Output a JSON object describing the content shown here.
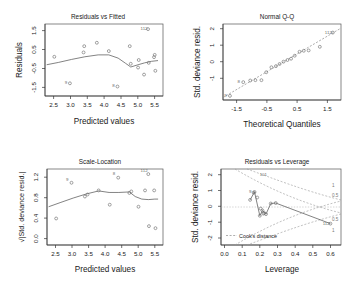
{
  "figure": {
    "name": "glm-diagnostic-plots",
    "layout": "2x2",
    "background": "#ffffff",
    "point_color": "#6f6f6f",
    "line_color": "#5a5a5a"
  },
  "chart_data": [
    {
      "type": "scatter",
      "id": "residuals-vs-fitted",
      "title": "Residuals vs Fitted",
      "xlabel": "Predicted values",
      "ylabel": "Residuals",
      "xlim": [
        2.2,
        5.75
      ],
      "ylim": [
        -1.95,
        1.85
      ],
      "xticks": [
        "2.5",
        "3.0",
        "3.5",
        "4.0",
        "4.5",
        "5.0",
        "5.5"
      ],
      "xtickvals": [
        2.5,
        3.0,
        3.5,
        4.0,
        4.5,
        5.0,
        5.5
      ],
      "yticks": [
        "1.5",
        "0.5",
        "-0.5",
        "-1.5"
      ],
      "ytickvals": [
        1.5,
        0.5,
        -0.5,
        -1.5
      ],
      "grid": false,
      "legend": "none",
      "x": [
        2.48,
        2.95,
        3.36,
        3.38,
        3.76,
        4.12,
        4.38,
        4.75,
        4.78,
        5.0,
        5.02,
        5.18,
        5.3,
        5.32,
        5.48,
        5.5,
        5.52
      ],
      "y": [
        0.12,
        -1.28,
        0.35,
        0.68,
        0.86,
        0.42,
        -1.45,
        0.68,
        -0.25,
        -0.45,
        -0.05,
        -0.82,
        1.58,
        -0.2,
        0.1,
        0.22,
        -0.62
      ],
      "point_labels": [
        "",
        "9",
        "",
        "",
        "",
        "",
        "8",
        "",
        "",
        "",
        "",
        "",
        "112",
        "",
        "",
        "",
        ""
      ],
      "smooth": {
        "name": "loess smoother",
        "x": [
          2.25,
          2.6,
          3.0,
          3.4,
          3.8,
          4.12,
          4.4,
          4.62,
          4.78,
          5.0,
          5.2,
          5.4,
          5.6
        ],
        "y": [
          -0.3,
          -0.18,
          -0.02,
          0.12,
          0.22,
          0.22,
          0.05,
          -0.22,
          -0.42,
          -0.3,
          -0.2,
          -0.12,
          -0.08
        ]
      }
    },
    {
      "type": "scatter",
      "id": "normal-qq",
      "title": "Normal Q-Q",
      "xlabel": "Theoretical Quantiles",
      "ylabel": "Std. deviance resid.",
      "xlim": [
        -1.95,
        1.95
      ],
      "ylim": [
        -2.3,
        2.3
      ],
      "xticks": [
        "-1.5",
        "-0.5",
        "0.5",
        "1.5"
      ],
      "xtickvals": [
        -1.5,
        -0.5,
        0.5,
        1.5
      ],
      "yticks": [
        "2",
        "1",
        "0",
        "-1"
      ],
      "ytickvals": [
        2,
        1,
        0,
        -1
      ],
      "grid": false,
      "legend": "none",
      "x": [
        -1.72,
        -1.28,
        -1.05,
        -0.88,
        -0.68,
        -0.52,
        -0.35,
        -0.2,
        -0.08,
        0.05,
        0.18,
        0.3,
        0.42,
        0.58,
        0.72,
        0.88,
        1.25,
        1.68
      ],
      "y": [
        -2.05,
        -1.22,
        -1.12,
        -1.1,
        -1.1,
        -0.62,
        -0.32,
        -0.25,
        -0.12,
        0.02,
        0.12,
        0.2,
        0.38,
        0.62,
        0.68,
        0.7,
        0.92,
        1.78
      ],
      "point_labels": [
        "9",
        "8",
        "",
        "",
        "",
        "",
        "",
        "",
        "",
        "",
        "",
        "",
        "",
        "",
        "",
        "",
        "",
        "112"
      ],
      "refline": {
        "name": "qq reference line",
        "x": [
          -1.95,
          1.95
        ],
        "y": [
          -2.15,
          2.05
        ]
      }
    },
    {
      "type": "scatter",
      "id": "scale-location",
      "title": "Scale-Location",
      "xlabel": "Predicted values",
      "ylabel": "√|Std. deviance resid.|",
      "xlim": [
        2.2,
        5.75
      ],
      "ylim": [
        -0.07,
        1.42
      ],
      "xticks": [
        "2.5",
        "3.0",
        "3.5",
        "4.0",
        "4.5",
        "5.0",
        "5.5"
      ],
      "xtickvals": [
        2.5,
        3.0,
        3.5,
        4.0,
        4.5,
        5.0,
        5.5
      ],
      "yticks": [
        "0.0",
        "0.4",
        "0.8",
        "1.2"
      ],
      "ytickvals": [
        0.0,
        0.4,
        0.8,
        1.2
      ],
      "grid": false,
      "legend": "none",
      "x": [
        2.48,
        2.95,
        3.36,
        3.44,
        3.78,
        4.12,
        4.38,
        4.72,
        4.78,
        5.0,
        5.2,
        5.3,
        5.32,
        5.48,
        5.52
      ],
      "y": [
        0.45,
        1.15,
        0.88,
        0.92,
        1.0,
        0.72,
        1.25,
        0.95,
        0.98,
        0.68,
        1.0,
        1.32,
        0.3,
        1.0,
        0.26
      ],
      "point_labels": [
        "",
        "9",
        "",
        "",
        "",
        "",
        "8",
        "",
        "",
        "",
        "",
        "112",
        "",
        "",
        ""
      ],
      "smooth": {
        "name": "loess smoother",
        "x": [
          2.25,
          2.6,
          3.0,
          3.4,
          3.78,
          4.1,
          4.4,
          4.72,
          4.9,
          5.1,
          5.3,
          5.5,
          5.6
        ],
        "y": [
          0.68,
          0.76,
          0.85,
          0.93,
          0.99,
          0.96,
          0.96,
          0.97,
          0.88,
          0.83,
          0.82,
          0.83,
          0.83
        ]
      }
    },
    {
      "type": "scatter",
      "id": "residuals-vs-leverage",
      "title": "Residuals vs Leverage",
      "xlabel": "Leverage",
      "ylabel": "Std. deviance resid.",
      "xlim": [
        -0.02,
        0.66
      ],
      "ylim": [
        -2.4,
        2.4
      ],
      "xticks": [
        "0.0",
        "0.1",
        "0.2",
        "0.3",
        "0.4",
        "0.5",
        "0.6"
      ],
      "xtickvals": [
        0.0,
        0.1,
        0.2,
        0.3,
        0.4,
        0.5,
        0.6
      ],
      "yticks": [
        "2",
        "1",
        "0",
        "-1",
        "-2"
      ],
      "ytickvals": [
        2,
        1,
        0,
        -1,
        -2
      ],
      "grid": false,
      "legend": "Cook's distance",
      "legend_position": "bottom-left",
      "x": [
        0.145,
        0.165,
        0.17,
        0.185,
        0.2,
        0.205,
        0.215,
        0.22,
        0.225,
        0.235,
        0.262,
        0.29,
        0.6
      ],
      "y": [
        0.45,
        0.9,
        0.95,
        0.6,
        -0.55,
        -0.1,
        -0.22,
        -0.42,
        -0.38,
        -0.45,
        0.22,
        0.25,
        -1.05
      ],
      "point_labels": [
        "",
        "",
        "9",
        "",
        "",
        "",
        "",
        "",
        "",
        "",
        "",
        "",
        "112"
      ],
      "annotations": [
        {
          "text": "101",
          "x": 0.22,
          "y": 1.95
        }
      ],
      "trace": {
        "name": "loess smoother",
        "x": [
          0.145,
          0.17,
          0.2,
          0.215,
          0.235,
          0.262,
          0.29,
          0.6
        ],
        "y": [
          0.45,
          0.95,
          -0.55,
          -0.22,
          -0.45,
          0.22,
          0.25,
          -1.05
        ]
      },
      "cook_contours": [
        {
          "level": "1",
          "side": "upper"
        },
        {
          "level": "0.5",
          "side": "upper"
        },
        {
          "level": "0.5",
          "side": "lower"
        },
        {
          "level": "1",
          "side": "lower"
        }
      ],
      "cook_contour_labels": [
        "1",
        "0.5",
        "0.5",
        "1"
      ],
      "zero_reference": 0
    }
  ]
}
